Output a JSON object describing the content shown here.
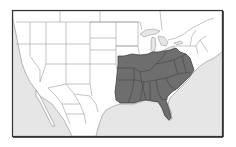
{
  "map": {
    "subject": "North America range map",
    "highlighted_region": "Eastern and southeastern United States",
    "colors": {
      "background": "#ffffff",
      "ocean": "#e6e6e6",
      "land": "#ffffff",
      "border": "#8a8a8a",
      "frame": "#333333",
      "highlight_fill": "#6e6e6e",
      "highlight_border": "#3a3a3a",
      "lakes": "#e6e6e6"
    },
    "frame": {
      "x": 12,
      "y": 10,
      "width": 211,
      "height": 127
    }
  }
}
